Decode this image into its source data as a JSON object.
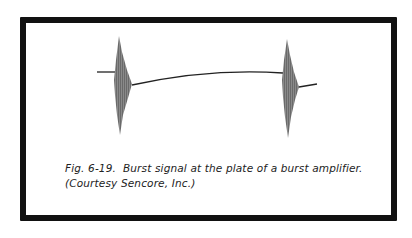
{
  "figure": {
    "label": "Fig. 6-19.",
    "caption_line1": "Fig. 6-19.  Burst signal at the plate of a burst amplifier.",
    "caption_line2": "(Courtesy Sencore, Inc.)",
    "colors": {
      "frame": "#111111",
      "burst": "#7a7a7a",
      "trace": "#222222"
    }
  }
}
